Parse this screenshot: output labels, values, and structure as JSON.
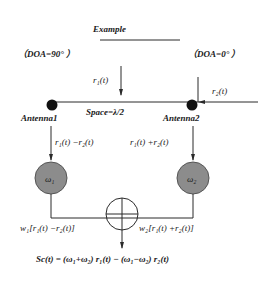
{
  "diagram": {
    "title": "Example",
    "left_doa": "（DOA=90° ）",
    "right_doa": "（DOA=0° ）",
    "signal_1": "r₁(t)",
    "signal_2": "r₂(t)",
    "spacing_label": "Space=λ/2",
    "antenna_1": "Antenna1",
    "antenna_2": "Antenna2",
    "branch_1_signal": "r₁(t) −r₂(t)",
    "branch_2_signal": "r₁(t) +r₂(t)",
    "weight_1": "ω₁",
    "weight_2": "ω₂",
    "weighted_1": "w₁[r₁(t) −r₂(t)]",
    "weighted_2": "w₂[r₁(t) +r₂(t)]",
    "output_equation": "Sc(t) = (ω₁+ω₂) r₁(t) − (ω₁−ω₂) r₂(t)",
    "colors": {
      "line": "#2a2a2a",
      "weight_fill": "#8c8c8c",
      "antenna_fill": "#111111"
    }
  }
}
